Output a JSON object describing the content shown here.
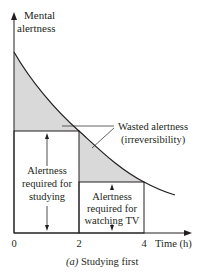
{
  "figure": {
    "y_axis_label_line1": "Mental",
    "y_axis_label_line2": "alertness",
    "x_axis_label": "Time (h)",
    "x_ticks": [
      "0",
      "2",
      "4"
    ],
    "caption_prefix": "(a)",
    "caption_text": " Studying first",
    "annotation_wasted_line1": "Wasted alertness",
    "annotation_wasted_line2": "(irreversibility)",
    "label_studying": [
      "Alertness",
      "required for",
      "studying"
    ],
    "label_tv": [
      "Alertness",
      "required for",
      "watching TV"
    ],
    "colors": {
      "shade": "#d9d9d9",
      "line": "#231f20"
    }
  }
}
